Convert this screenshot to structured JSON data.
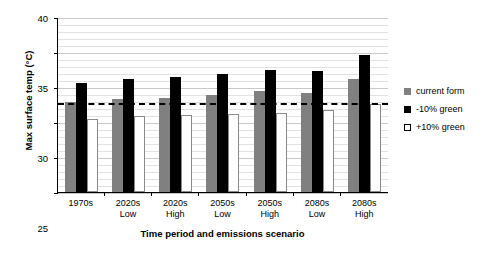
{
  "chart_data": {
    "type": "bar",
    "title": "",
    "xlabel": "Time period and emissions scenario",
    "ylabel": "Max surface temp (°C)",
    "categories": [
      "1970s",
      "2020s Low",
      "2020s High",
      "2050s Low",
      "2050s High",
      "2080s Low",
      "2080s High"
    ],
    "category_lines": [
      [
        "1970s",
        ""
      ],
      [
        "2020s",
        "Low"
      ],
      [
        "2020s",
        "High"
      ],
      [
        "2050s",
        "Low"
      ],
      [
        "2050s",
        "High"
      ],
      [
        "2080s",
        "Low"
      ],
      [
        "2080s",
        "High"
      ]
    ],
    "series": [
      {
        "name": "current form",
        "color": "#808080",
        "values": [
          27.9,
          28.3,
          28.5,
          28.8,
          29.5,
          29.2,
          31.2
        ]
      },
      {
        "name": "-10% green",
        "color": "#000000",
        "values": [
          30.6,
          31.2,
          31.5,
          31.8,
          32.5,
          32.3,
          34.6
        ]
      },
      {
        "name": "+10% green",
        "color": "#ffffff",
        "values": [
          25.4,
          25.9,
          26.0,
          26.1,
          26.3,
          26.7,
          27.6
        ]
      }
    ],
    "ylim": [
      15,
      40
    ],
    "ytick_values": [
      15,
      20,
      25,
      30,
      35,
      40
    ],
    "ytick_labels": [
      "15",
      "20",
      "25",
      "30",
      "35",
      "40"
    ],
    "ytick_step": 5,
    "minor_gridline_step": 1,
    "grid": true,
    "legend_position": "right",
    "reference_line": {
      "value": 27.9,
      "style": "dashed",
      "color": "#000000",
      "label": ""
    }
  },
  "legend": {
    "items": [
      {
        "label": "current form",
        "swatch": "current"
      },
      {
        "label": "-10% green",
        "swatch": "minus"
      },
      {
        "label": "+10% green",
        "swatch": "plus"
      }
    ]
  }
}
